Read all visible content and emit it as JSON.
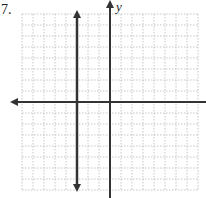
{
  "problem": {
    "number_label": "7."
  },
  "axes": {
    "y_label": "y",
    "x_label": ""
  },
  "colors": {
    "grid": "#b8b8b8",
    "axis": "#333333",
    "line": "#333333",
    "background": "#ffffff"
  },
  "chart_data": {
    "type": "line",
    "title": "7.",
    "xlabel": "",
    "ylabel": "y",
    "grid": true,
    "xlim": [
      -8,
      8
    ],
    "ylim": [
      -8,
      8
    ],
    "series": [
      {
        "name": "vertical line x = -3",
        "x": [
          -3,
          -3
        ],
        "y": [
          -8,
          8
        ],
        "arrows": "both"
      }
    ]
  }
}
